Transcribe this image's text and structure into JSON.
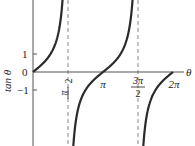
{
  "chart_data": {
    "type": "line",
    "title": "",
    "xlabel": "θ",
    "ylabel": "tan θ",
    "function": "tan(θ)",
    "x_domain": [
      0,
      6.2832
    ],
    "ylim": [
      -4,
      4
    ],
    "x_ticks": [
      {
        "value": 1.5708,
        "label_num": "π",
        "label_den": "2",
        "dashed_asymptote": true
      },
      {
        "value": 3.1416,
        "label": "π"
      },
      {
        "value": 4.7124,
        "label_num": "3π",
        "label_den": "2",
        "dashed_asymptote": true
      },
      {
        "value": 6.2832,
        "label": "2π"
      }
    ],
    "y_ticks": [
      {
        "value": 1,
        "label": "1"
      },
      {
        "value": 0,
        "label": "0"
      },
      {
        "value": -1,
        "label": "−1"
      }
    ],
    "asymptotes": [
      1.5708,
      4.7124
    ],
    "series": [
      {
        "name": "tan θ",
        "points": [
          [
            0,
            0
          ],
          [
            0.785,
            1
          ],
          [
            1.326,
            4
          ],
          [
            1.816,
            -4
          ],
          [
            2.356,
            -1
          ],
          [
            3.1416,
            0
          ],
          [
            3.927,
            1
          ],
          [
            4.467,
            4
          ],
          [
            4.957,
            -4
          ],
          [
            5.498,
            -1
          ],
          [
            6.2832,
            0
          ]
        ]
      }
    ],
    "grid": false,
    "legend": null,
    "colors": {
      "curve": "#2a2a2a",
      "axis": "#555555",
      "asymptote": "#888888"
    }
  },
  "labels": {
    "ylabel": "tan θ",
    "xlabel": "θ",
    "y1": "1",
    "y0": "0",
    "ym1": "−1",
    "pi2_num": "π",
    "pi2_den": "2",
    "pi": "π",
    "pi32_num": "3π",
    "pi32_den": "2",
    "twopi": "2π"
  }
}
